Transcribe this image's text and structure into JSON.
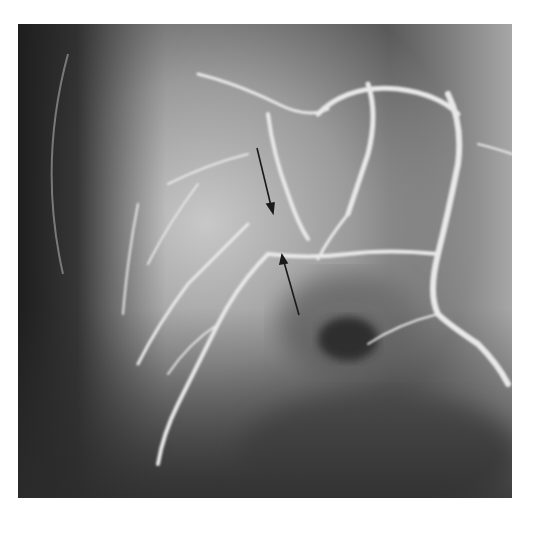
{
  "image": {
    "kind": "grayscale angiogram",
    "annotations": [
      {
        "type": "arrow",
        "direction": "down-right",
        "from": [
          257,
          148
        ],
        "to": [
          272,
          208
        ]
      },
      {
        "type": "arrow",
        "direction": "up-left",
        "from": [
          299,
          315
        ],
        "to": [
          283,
          256
        ]
      }
    ]
  }
}
